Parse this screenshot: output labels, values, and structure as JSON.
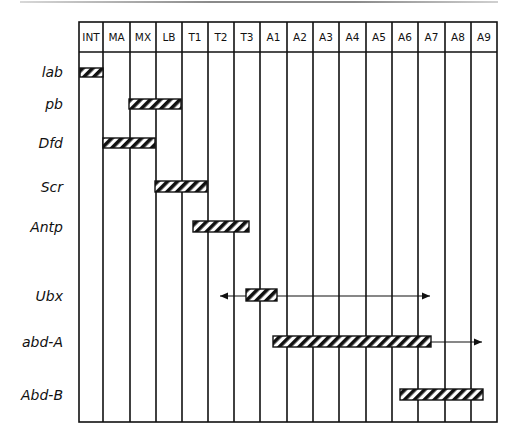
{
  "figure": {
    "type": "hox-gene-expression-domains",
    "segments": [
      "INT",
      "MA",
      "MX",
      "LB",
      "T1",
      "T2",
      "T3",
      "A1",
      "A2",
      "A3",
      "A4",
      "A5",
      "A6",
      "A7",
      "A8",
      "A9"
    ],
    "genes": [
      {
        "name": "lab",
        "bar": {
          "from": "INT",
          "to": "INT"
        },
        "arrows": null
      },
      {
        "name": "pb",
        "bar": {
          "from": "MX",
          "to": "LB"
        },
        "arrows": null
      },
      {
        "name": "Dfd",
        "bar": {
          "from": "MA",
          "to": "MX"
        },
        "arrows": null
      },
      {
        "name": "Scr",
        "bar": {
          "from": "LB",
          "to": "T1"
        },
        "arrows": null
      },
      {
        "name": "Antp",
        "bar": {
          "from": "T1 (posterior half)",
          "to": "T3 (anterior half)"
        },
        "arrows": null
      },
      {
        "name": "Ubx",
        "bar": {
          "from": "T3 (posterior half)",
          "to": "A1 (anterior)"
        },
        "arrows": {
          "left_to": "T2 (middle)",
          "right_to": "A6 (end)"
        }
      },
      {
        "name": "abd-A",
        "bar": {
          "from": "A1 (anterior)",
          "to": "A6"
        },
        "arrows": {
          "right_to": "A8"
        }
      },
      {
        "name": "Abd-B",
        "bar": {
          "from": "A6 (posterior)",
          "to": "A9"
        },
        "arrows": null
      }
    ],
    "colors": {
      "line": "#111111",
      "hatch": "#111111",
      "background": "#ffffff",
      "top_rule": "#8a8a8a"
    }
  }
}
